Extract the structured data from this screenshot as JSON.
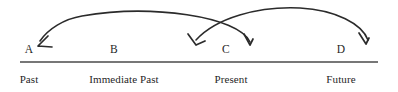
{
  "figure": {
    "width": 398,
    "height": 92,
    "background_color": "#ffffff",
    "line_color": "#2b2b2b",
    "rule_color": "#4a4a4a",
    "text_color": "#1f1f1f"
  },
  "timeline": {
    "axis": {
      "x_start": 20,
      "x_end": 378,
      "y": 62
    },
    "nodes": [
      {
        "id": "A",
        "label": "A",
        "x": 29,
        "y": 50
      },
      {
        "id": "B",
        "label": "B",
        "x": 114,
        "y": 50
      },
      {
        "id": "C",
        "label": "C",
        "x": 226,
        "y": 50
      },
      {
        "id": "D",
        "label": "D",
        "x": 341,
        "y": 50
      }
    ],
    "periods": [
      {
        "id": "past",
        "label": "Past",
        "x": 29,
        "y": 80
      },
      {
        "id": "immediate-past",
        "label": "Immediate Past",
        "x": 124,
        "y": 80
      },
      {
        "id": "present",
        "label": "Present",
        "x": 231,
        "y": 80
      },
      {
        "id": "future",
        "label": "Future",
        "x": 341,
        "y": 80
      }
    ]
  },
  "arrows": [
    {
      "id": "arc-present-to-past",
      "from_node": "C",
      "to_node": "A",
      "path": "M 250 42 C 238 16 150 4 82 16 C 64 19 48 29 40 41",
      "head": "M 48 36 L 38 46 M 52 47 L 38 46",
      "direction": "right-to-left"
    },
    {
      "id": "arc-future-to-immediate-past",
      "from_node": "D",
      "to_node": "B-C",
      "path": "M 368 40 C 362 24 336 10 300 8 C 258 6 216 18 196 40",
      "head": "M 188 34 L 196 45 M 205 41 L 196 45",
      "direction": "right-to-left"
    },
    {
      "id": "arc-head-near-present",
      "from_node": "B",
      "to_node": "C",
      "path": "",
      "head": "M 244 34 L 250 45 M 253 39 L 250 45",
      "direction": "left-to-right"
    },
    {
      "id": "arc-head-near-future",
      "from_node": "C",
      "to_node": "D",
      "path": "",
      "head": "M 359 33 L 366 44 M 369 38 L 366 44",
      "direction": "left-to-right"
    }
  ]
}
